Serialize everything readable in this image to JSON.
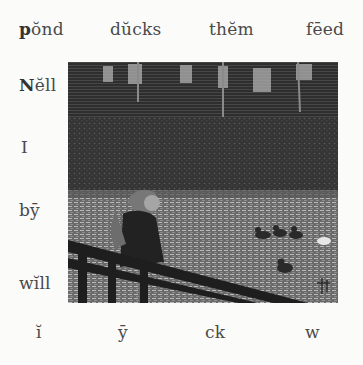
{
  "lesson": {
    "top_words": [
      {
        "bold": "p",
        "rest": "ŏnd"
      },
      {
        "bold": "",
        "rest": "dŭcks"
      },
      {
        "bold": "",
        "rest": "thĕm"
      },
      {
        "bold": "",
        "rest": "fēed"
      }
    ],
    "left_words": [
      {
        "bold": "N",
        "rest": "ĕll"
      },
      {
        "bold": "",
        "rest": "I"
      },
      {
        "bold": "",
        "rest": "bȳ"
      },
      {
        "bold": "",
        "rest": "wĭll"
      }
    ],
    "bottom_sounds": [
      "ĭ",
      "ȳ",
      "ck",
      "w"
    ]
  },
  "illustration": {
    "subject": "Girl leaning on a wooden railing beside a pond watching ducks",
    "signature_mark": "monogram"
  },
  "colors": {
    "paper": "#fbfbfa",
    "ink": "#444444"
  }
}
